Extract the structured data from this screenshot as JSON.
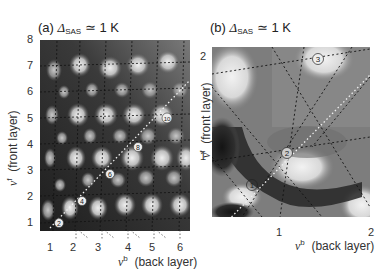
{
  "panels": [
    {
      "id": "a",
      "label_prefix": "(a) ",
      "label_symbol": "Δ",
      "label_sub": "SAS",
      "label_suffix": " ≃ 1 K",
      "y_ticks": [
        "1",
        "2",
        "3",
        "4",
        "5",
        "6",
        "7",
        "8"
      ],
      "x_ticks": [
        "1",
        "2",
        "3",
        "4",
        "5",
        "6"
      ],
      "x_axis_symbol": "ν",
      "x_axis_sup": "b",
      "x_axis_text": "(back layer)",
      "y_axis_symbol": "ν",
      "y_axis_sup": "f",
      "y_axis_text": "(front layer)",
      "markers": [
        "2",
        "4",
        "6",
        "8",
        "10"
      ]
    },
    {
      "id": "b",
      "label_prefix": "(b) ",
      "label_symbol": "Δ",
      "label_sub": "SAS",
      "label_suffix": " ≃ 1 K",
      "y_ticks": [
        "1",
        "2"
      ],
      "x_ticks": [
        "1",
        "2"
      ],
      "x_axis_symbol": "ν",
      "x_axis_sup": "b",
      "x_axis_text": "(back layer)",
      "y_axis_symbol": "ν",
      "y_axis_sup": "f",
      "y_axis_text": "(front layer)",
      "markers": [
        "1",
        "2",
        "3"
      ]
    }
  ],
  "colors": {
    "dark": "#2a2a2a",
    "mid": "#777777",
    "light": "#e6e6e6",
    "dashed_dark": "#222222",
    "dashed_light": "#f0f0f0"
  }
}
